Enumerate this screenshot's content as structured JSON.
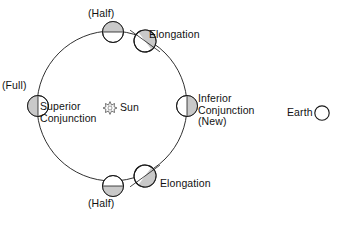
{
  "diagram": {
    "colors": {
      "stroke": "#1a1a1a",
      "text": "#121212",
      "shade": "#c9c9c9",
      "background": "#ffffff"
    },
    "orbit": {
      "center_x": 112,
      "center_y": 106,
      "radius": 75,
      "stroke_width": 0.9
    },
    "sun": {
      "label": "Sun",
      "icon": "sun-burst-icon",
      "x": 110,
      "y": 108,
      "rays": 12,
      "inner_radius": 2.6,
      "outer_radius": 6.2
    },
    "earth": {
      "label": "Earth",
      "icon": "earth-circle-icon",
      "x": 322,
      "y": 113,
      "radius": 7.2,
      "shading": "none"
    },
    "bodies": [
      {
        "id": "superior-conjunction",
        "x": 38,
        "y": 106,
        "radius": 10.5,
        "shading": "left-half",
        "divider_angle_deg": 90,
        "labels": [
          "(Full)",
          "Superior",
          "Conjunction"
        ]
      },
      {
        "id": "half-top",
        "x": 113,
        "y": 32,
        "radius": 10.5,
        "shading": "top-half",
        "divider_angle_deg": 0,
        "labels": [
          "(Half)"
        ]
      },
      {
        "id": "elongation-top",
        "x": 145,
        "y": 41,
        "radius": 11.0,
        "shading": "upper-right-diagonal",
        "divider_angle_deg": 28,
        "labels": [
          "Elongation"
        ]
      },
      {
        "id": "inferior-conjunction",
        "x": 187,
        "y": 106,
        "radius": 10.5,
        "shading": "right-half",
        "divider_angle_deg": 90,
        "labels": [
          "Inferior",
          "Conjunction",
          "(New)"
        ]
      },
      {
        "id": "elongation-bottom",
        "x": 145,
        "y": 176,
        "radius": 11.0,
        "shading": "lower-right-diagonal",
        "divider_angle_deg": -28,
        "labels": [
          "Elongation"
        ]
      },
      {
        "id": "half-bottom",
        "x": 113,
        "y": 186,
        "radius": 10.5,
        "shading": "bottom-half",
        "divider_angle_deg": 0,
        "labels": [
          "(Half)"
        ]
      }
    ],
    "labels": {
      "half_top": "(Half)",
      "elongation_top": "Elongation",
      "full": "(Full)",
      "superior_line1": "Superior",
      "superior_line2": "Conjunction",
      "sun": "Sun",
      "inferior_line1": "Inferior",
      "inferior_line2": "Conjunction",
      "inferior_line3": "(New)",
      "earth": "Earth",
      "elongation_bottom": "Elongation",
      "half_bottom": "(Half)"
    }
  }
}
